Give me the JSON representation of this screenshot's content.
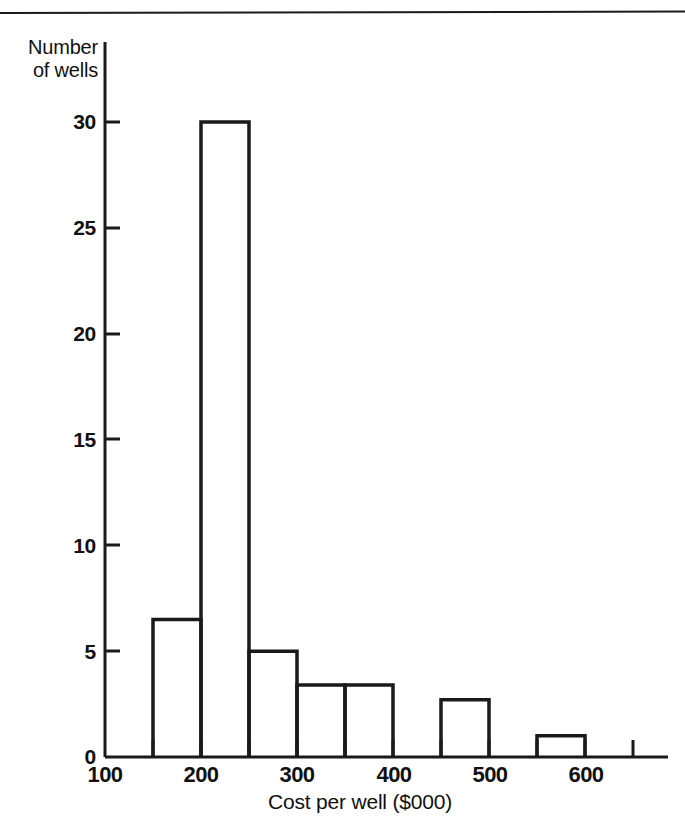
{
  "figure": {
    "background_color": "#ffffff",
    "line_color": "#1a1a1a",
    "has_top_rule": true
  },
  "chart_data": {
    "type": "bar",
    "title": "",
    "subtitle": "",
    "xlabel": "Cost per well ($000)",
    "ylabel": "Number\nof wells",
    "ylabel_line1": "Number",
    "ylabel_line2": "of wells",
    "xlim": [
      100,
      640
    ],
    "ylim": [
      0,
      31
    ],
    "grid": false,
    "legend": null,
    "bar_style": "outline",
    "bin_width": 50,
    "categories": [
      "100-150",
      "150-200",
      "200-250",
      "250-300",
      "300-350",
      "350-400",
      "400-450",
      "450-500",
      "500-550",
      "550-600"
    ],
    "bin_edges": [
      100,
      150,
      200,
      250,
      300,
      350,
      400,
      450,
      500,
      550,
      600
    ],
    "values": [
      0,
      6.5,
      30,
      5,
      3.4,
      3.4,
      0,
      2.7,
      0,
      1
    ],
    "xticks": [
      100,
      200,
      300,
      400,
      500,
      600
    ],
    "xtick_labels": [
      "100",
      "200",
      "300",
      "400",
      "500",
      "600"
    ],
    "xtick_minor": [
      150,
      250,
      350,
      450,
      550,
      640
    ],
    "yticks": [
      0,
      5,
      10,
      15,
      20,
      25,
      30
    ],
    "ytick_labels": [
      "0",
      "5",
      "10",
      "15",
      "20",
      "25",
      "30"
    ]
  }
}
